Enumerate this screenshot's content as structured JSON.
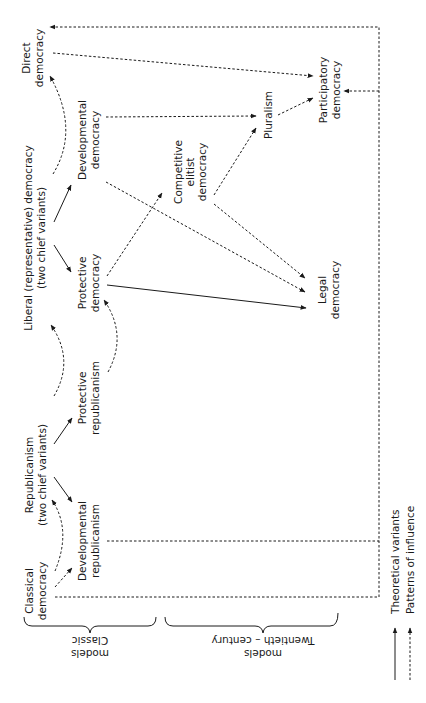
{
  "diagram": {
    "orientation": "rotated 90 degrees counter-clockwise",
    "nodes": {
      "classical_democracy": [
        "Classical",
        "democracy"
      ],
      "republicanism": [
        "Republicanism",
        "(two chief variants)"
      ],
      "protective_republicanism": [
        "Protective",
        "republicanism"
      ],
      "developmental_republicanism": [
        "Developmental",
        "republicanism"
      ],
      "liberal_democracy": [
        "Liberal (representative) democracy",
        "(two chief variants)"
      ],
      "protective_democracy": [
        "Protective",
        "democracy"
      ],
      "developmental_democracy": [
        "Developmental",
        "democracy"
      ],
      "direct_democracy": [
        "Direct",
        "democracy"
      ],
      "competitive_elitist_democracy": [
        "Competitive",
        "elitist",
        "democracy"
      ],
      "pluralism": [
        "Pluralism"
      ],
      "legal_democracy": [
        "Legal",
        "democracy"
      ],
      "participatory_democracy": [
        "Participatory",
        "democracy"
      ]
    },
    "groups": {
      "classic": [
        "Classic",
        "models"
      ],
      "twentieth": [
        "Twentieth – century",
        "models"
      ]
    },
    "legend": {
      "solid": "Theoretical variants",
      "dashed": "Patterns of influence"
    },
    "edges": [
      {
        "from": "Republicanism",
        "to": "Developmental republicanism",
        "type": "theoretical variant"
      },
      {
        "from": "Republicanism",
        "to": "Protective republicanism",
        "type": "theoretical variant"
      },
      {
        "from": "Liberal democracy",
        "to": "Protective democracy",
        "type": "theoretical variant"
      },
      {
        "from": "Liberal democracy",
        "to": "Developmental democracy",
        "type": "theoretical variant"
      },
      {
        "from": "Protective democracy",
        "to": "Legal democracy",
        "type": "theoretical variant"
      },
      {
        "from": "Classical democracy",
        "to": "Republicanism",
        "type": "influence"
      },
      {
        "from": "Classical democracy",
        "to": "Developmental republicanism",
        "type": "influence"
      },
      {
        "from": "Republicanism",
        "to": "Liberal democracy",
        "type": "influence"
      },
      {
        "from": "Liberal democracy",
        "to": "Direct democracy",
        "type": "influence"
      },
      {
        "from": "Protective republicanism",
        "to": "Protective democracy",
        "type": "influence"
      },
      {
        "from": "Protective democracy",
        "to": "Competitive elitist democracy",
        "type": "influence"
      },
      {
        "from": "Developmental democracy",
        "to": "Pluralism",
        "type": "influence"
      },
      {
        "from": "Developmental democracy",
        "to": "Legal democracy",
        "type": "influence"
      },
      {
        "from": "Competitive elitist democracy",
        "to": "Pluralism",
        "type": "influence"
      },
      {
        "from": "Competitive elitist democracy",
        "to": "Legal democracy",
        "type": "influence"
      },
      {
        "from": "Pluralism",
        "to": "Participatory democracy",
        "type": "influence"
      },
      {
        "from": "Direct democracy",
        "to": "Participatory democracy",
        "type": "influence"
      },
      {
        "from": "Classical democracy",
        "to": "Direct democracy",
        "type": "influence"
      },
      {
        "from": "Classical democracy",
        "to": "Participatory democracy",
        "type": "influence"
      },
      {
        "from": "Developmental republicanism",
        "to": "Participatory democracy",
        "type": "influence"
      }
    ]
  }
}
